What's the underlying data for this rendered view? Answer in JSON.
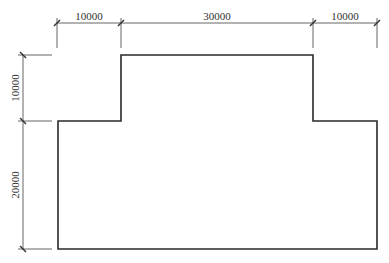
{
  "diagram": {
    "type": "dimensioned floor plan outline",
    "top_dimensions": [
      {
        "label": "10000",
        "x1": 57,
        "x2": 121
      },
      {
        "label": "30000",
        "x1": 121,
        "x2": 313
      },
      {
        "label": "10000",
        "x1": 313,
        "x2": 377
      }
    ],
    "left_dimensions": [
      {
        "label": "10000",
        "y1": 55,
        "y2": 121
      },
      {
        "label": "20000",
        "y1": 121,
        "y2": 249
      }
    ],
    "colors": {
      "outline": "#2a2a2a",
      "dimension": "#555555",
      "text": "#333333"
    }
  }
}
